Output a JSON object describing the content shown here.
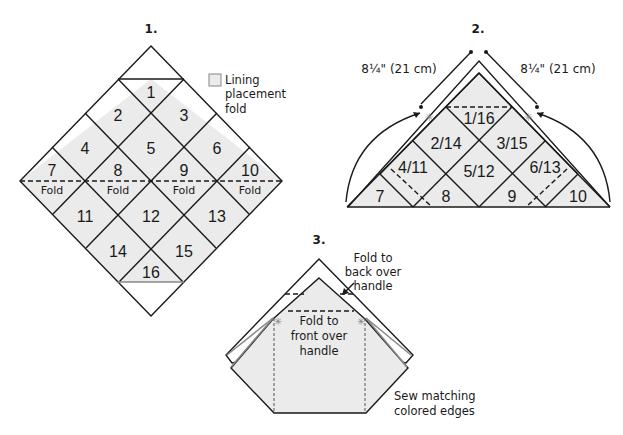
{
  "diagram1": {
    "step_label": "1.",
    "squares": [
      "1",
      "2",
      "3",
      "4",
      "5",
      "6",
      "7",
      "8",
      "9",
      "10",
      "11",
      "12",
      "13",
      "14",
      "15",
      "16"
    ],
    "fold_labels": [
      "Fold",
      "Fold",
      "Fold",
      "Fold"
    ],
    "legend": {
      "line1": "Lining",
      "line2": "placement",
      "line3": "fold"
    }
  },
  "diagram2": {
    "step_label": "2.",
    "left_measure": "8¼\" (21 cm)",
    "right_measure": "8¼\" (21 cm)",
    "squares": [
      "1/16",
      "2/14",
      "3/15",
      "4/11",
      "5/12",
      "6/13",
      "7",
      "8",
      "9",
      "10"
    ]
  },
  "diagram3": {
    "step_label": "3.",
    "back_fold_note": [
      "Fold to",
      "back over",
      "handle"
    ],
    "front_fold_note": [
      "Fold to",
      "front over",
      "handle"
    ],
    "sew_note": [
      "Sew matching",
      "colored edges"
    ]
  }
}
